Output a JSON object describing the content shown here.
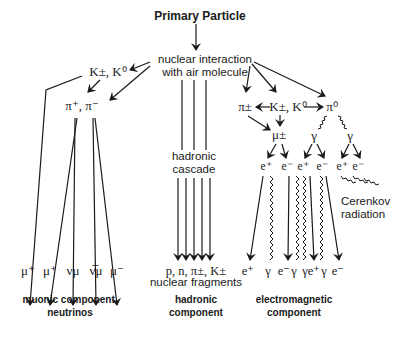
{
  "title": "Primary Particle",
  "interaction": {
    "line1": "nuclear interaction",
    "line2": "with air molecule"
  },
  "muonic": {
    "kaons": "K±, K⁰",
    "pions": "π⁺, π⁻",
    "products": [
      "μ⁺",
      "μ⁺",
      "νμ",
      "ν̅μ",
      "μ⁻"
    ],
    "label_line1": "muonic component,",
    "label_line2": "neutrinos"
  },
  "hadronic": {
    "cascade_line1": "hadronic",
    "cascade_line2": "cascade",
    "products": "p, n, π±, K±",
    "fragments": "nuclear fragments",
    "label_line1": "hadronic",
    "label_line2": "component"
  },
  "electromagnetic": {
    "pi_charged": "π±",
    "kaons": "K±, K⁰",
    "pi_neutral": "π⁰",
    "muon": "μ±",
    "gamma1": "γ",
    "gamma2": "γ",
    "pairs": [
      "e⁺",
      "e⁻",
      "e⁺",
      "e⁻",
      "e⁺",
      "e⁻"
    ],
    "cerenkov_line1": "Cerenkov",
    "cerenkov_line2": "radiation",
    "products": [
      "e⁺",
      "γ",
      "e⁻",
      "γ",
      "γ",
      "e⁺",
      "γ",
      "e⁻"
    ],
    "label_line1": "electromagnetic",
    "label_line2": "component"
  }
}
